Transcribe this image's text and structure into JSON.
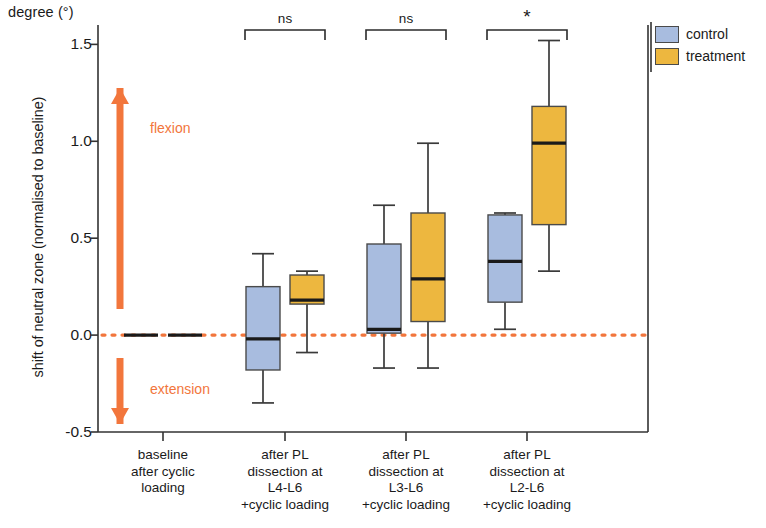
{
  "chart_data": {
    "type": "box",
    "title": "",
    "ylabel": "shift of neutral zone (normalised to baseline)",
    "yunit_label": "degree (°)",
    "xlabel": "",
    "ylim": [
      -0.5,
      1.6
    ],
    "yticks": [
      -0.5,
      0.0,
      0.5,
      1.0,
      1.5
    ],
    "ytick_labels": [
      "-0.5",
      "0.0",
      "0.5",
      "1.0",
      "1.5"
    ],
    "grid": false,
    "legend_position": "right-top",
    "zero_reference_line": 0.0,
    "categories": [
      "baseline\nafter cyclic\nloading",
      "after PL\ndissection at\nL4-L6\n+cyclic loading",
      "after PL\ndissection at\nL3-L6\n+cyclic loading",
      "after PL\ndissection at\nL2-L6\n+cyclic loading"
    ],
    "series": [
      {
        "name": "control",
        "color": "#a8bcdf",
        "boxes": [
          {
            "whisker_low": 0.0,
            "q1": 0.0,
            "median": 0.0,
            "q3": 0.0,
            "whisker_high": 0.0
          },
          {
            "whisker_low": -0.35,
            "q1": -0.18,
            "median": -0.02,
            "q3": 0.25,
            "whisker_high": 0.42
          },
          {
            "whisker_low": -0.17,
            "q1": 0.01,
            "median": 0.03,
            "q3": 0.47,
            "whisker_high": 0.67
          },
          {
            "whisker_low": 0.03,
            "q1": 0.17,
            "median": 0.38,
            "q3": 0.62,
            "whisker_high": 0.63
          }
        ]
      },
      {
        "name": "treatment",
        "color": "#edb73f",
        "boxes": [
          {
            "whisker_low": 0.0,
            "q1": 0.0,
            "median": 0.0,
            "q3": 0.0,
            "whisker_high": 0.0
          },
          {
            "whisker_low": -0.09,
            "q1": 0.16,
            "median": 0.18,
            "q3": 0.31,
            "whisker_high": 0.33
          },
          {
            "whisker_low": -0.17,
            "q1": 0.07,
            "median": 0.29,
            "q3": 0.63,
            "whisker_high": 0.99
          },
          {
            "whisker_low": 0.33,
            "q1": 0.57,
            "median": 0.99,
            "q3": 1.18,
            "whisker_high": 1.52
          }
        ]
      }
    ],
    "significance": [
      {
        "group": "after PL dissection at L4-L6 +cyclic loading",
        "label": "ns"
      },
      {
        "group": "after PL dissection at L3-L6 +cyclic loading",
        "label": "ns"
      },
      {
        "group": "after PL dissection at L2-L6 +cyclic loading",
        "label": "*"
      }
    ],
    "annotations": [
      {
        "name": "flexion",
        "label": "flexion",
        "direction": "up",
        "color": "#f2763c"
      },
      {
        "name": "extension",
        "label": "extension",
        "direction": "down",
        "color": "#f2763c"
      }
    ]
  },
  "legend": {
    "items": [
      {
        "label": "control",
        "color": "#a8bcdf"
      },
      {
        "label": "treatment",
        "color": "#edb73f"
      }
    ]
  },
  "axes": {
    "unit_label": "degree (°)",
    "y_title": "shift of neutral zone (normalised to baseline)"
  },
  "colors": {
    "control": "#a8bcdf",
    "treatment": "#edb73f",
    "accent_orange": "#f2763c",
    "axis": "#333333",
    "zero_line": "#f2763c"
  }
}
